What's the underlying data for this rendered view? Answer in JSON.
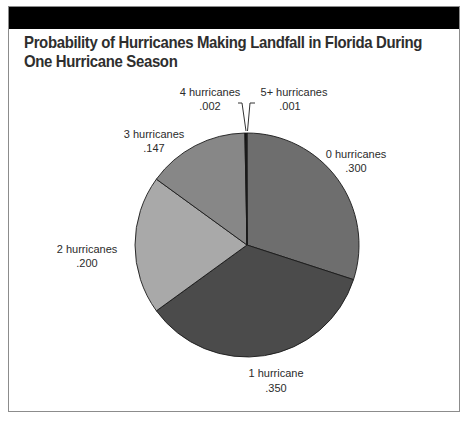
{
  "header": {
    "title": "Probability of Hurricanes Making Landfall in Florida During One Hurricane Season"
  },
  "chart_data": {
    "type": "pie",
    "title": "Probability of Hurricanes Making Landfall in Florida During One Hurricane Season",
    "categories": [
      "0 hurricanes",
      "1 hurricane",
      "2 hurricanes",
      "3 hurricanes",
      "4 hurricanes",
      "5+ hurricanes"
    ],
    "values": [
      0.3,
      0.35,
      0.2,
      0.147,
      0.002,
      0.001
    ],
    "value_labels": [
      ".300",
      ".350",
      ".200",
      ".147",
      ".002",
      ".001"
    ],
    "colors": [
      "#6e6e6e",
      "#4b4b4b",
      "#a9a9a9",
      "#878787",
      "#111111",
      "#333333"
    ],
    "start_angle_deg": 0,
    "direction": "clockwise",
    "legend": "none (direct labels)"
  },
  "labels": [
    {
      "name": "0 hurricanes",
      "value": ".300"
    },
    {
      "name": "1 hurricane",
      "value": ".350"
    },
    {
      "name": "2 hurricanes",
      "value": ".200"
    },
    {
      "name": "3 hurricanes",
      "value": ".147"
    },
    {
      "name": "4 hurricanes",
      "value": ".002"
    },
    {
      "name": "5+ hurricanes",
      "value": ".001"
    }
  ]
}
